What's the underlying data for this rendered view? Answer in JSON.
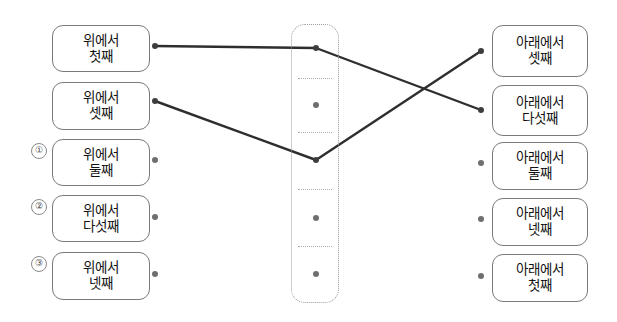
{
  "page": {
    "kind": "matching-exercise",
    "background_color": "#ffffff",
    "box_border_color": "#7a7a7a",
    "dot_color": "#6f6f6f",
    "line_color": "#2e2e2e",
    "dashed_color": "#9a9a9a"
  },
  "left_column": {
    "name": "left-options",
    "items": [
      {
        "num": "",
        "line1": "위에서",
        "line2": "첫째",
        "x": 52,
        "y": 25,
        "w": 98,
        "h": 47,
        "dot_x": 155,
        "dot_y": 46,
        "connected": true
      },
      {
        "num": "",
        "line1": "위에서",
        "line2": "셋째",
        "x": 52,
        "y": 82,
        "w": 98,
        "h": 48,
        "dot_x": 155,
        "dot_y": 101,
        "connected": true
      },
      {
        "num": "①",
        "line1": "위에서",
        "line2": "둘째",
        "x": 52,
        "y": 139,
        "w": 98,
        "h": 47,
        "dot_x": 155,
        "dot_y": 160,
        "connected": false
      },
      {
        "num": "②",
        "line1": "위에서",
        "line2": "다섯째",
        "x": 52,
        "y": 195,
        "w": 98,
        "h": 47,
        "dot_x": 155,
        "dot_y": 217,
        "connected": false
      },
      {
        "num": "③",
        "line1": "위에서",
        "line2": "넷째",
        "x": 52,
        "y": 252,
        "w": 98,
        "h": 48,
        "dot_x": 155,
        "dot_y": 274,
        "connected": false
      }
    ]
  },
  "center_panel": {
    "name": "center-slot-panel",
    "x": 291,
    "y": 24,
    "w": 48,
    "h": 279,
    "cells": [
      {
        "dot_x": 316,
        "dot_y": 48,
        "connected": true
      },
      {
        "dot_x": 316,
        "dot_y": 105,
        "connected": false
      },
      {
        "dot_x": 316,
        "dot_y": 160,
        "connected": true
      },
      {
        "dot_x": 316,
        "dot_y": 218,
        "connected": false
      },
      {
        "dot_x": 316,
        "dot_y": 274,
        "connected": false
      }
    ],
    "dividers_y": [
      78,
      132,
      189,
      246
    ]
  },
  "right_column": {
    "name": "right-options",
    "items": [
      {
        "line1": "아래에서",
        "line2": "셋째",
        "x": 492,
        "y": 25,
        "w": 96,
        "h": 52,
        "dot_x": 481,
        "dot_y": 51,
        "connected": true
      },
      {
        "line1": "아래에서",
        "line2": "다섯째",
        "x": 492,
        "y": 85,
        "w": 96,
        "h": 51,
        "dot_x": 481,
        "dot_y": 110,
        "connected": true
      },
      {
        "line1": "아래에서",
        "line2": "둘째",
        "x": 492,
        "y": 142,
        "w": 96,
        "h": 48,
        "dot_x": 481,
        "dot_y": 163,
        "connected": false
      },
      {
        "line1": "아래에서",
        "line2": "넷째",
        "x": 492,
        "y": 198,
        "w": 96,
        "h": 48,
        "dot_x": 481,
        "dot_y": 219,
        "connected": false
      },
      {
        "line1": "아래에서",
        "line2": "첫째",
        "x": 492,
        "y": 254,
        "w": 96,
        "h": 48,
        "dot_x": 481,
        "dot_y": 276,
        "connected": false
      }
    ]
  },
  "connections": [
    {
      "name": "line-left1-to-center1",
      "x1": 155,
      "y1": 46,
      "x2": 316,
      "y2": 48
    },
    {
      "name": "line-center1-to-right2",
      "x1": 316,
      "y1": 48,
      "x2": 481,
      "y2": 110
    },
    {
      "name": "line-left2-to-center3",
      "x1": 155,
      "y1": 101,
      "x2": 316,
      "y2": 160
    },
    {
      "name": "line-center3-to-right1",
      "x1": 316,
      "y1": 160,
      "x2": 481,
      "y2": 51
    }
  ]
}
